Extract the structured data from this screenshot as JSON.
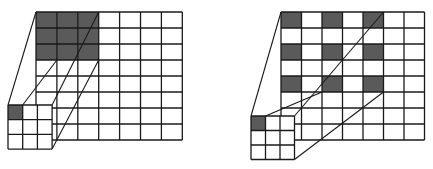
{
  "colors": {
    "shade": "#5a5a5a",
    "line": "#1a1a1a",
    "background": "#ffffff"
  },
  "panels": [
    {
      "name": "standard-convolution",
      "input_grid": {
        "x": 36,
        "y": 12,
        "cols": 7,
        "rows": 8,
        "cw": 20.9,
        "rh": 16,
        "shaded": [
          [
            0,
            0
          ],
          [
            0,
            1
          ],
          [
            0,
            2
          ],
          [
            1,
            0
          ],
          [
            1,
            1
          ],
          [
            1,
            2
          ],
          [
            2,
            0
          ],
          [
            2,
            1
          ],
          [
            2,
            2
          ]
        ]
      },
      "kernel": {
        "x": 8,
        "y": 105,
        "size": 3,
        "cell": 14.7,
        "depth_dx": 28,
        "depth_dy": -47,
        "shaded": [
          [
            0,
            0
          ]
        ]
      },
      "receptive_field": {
        "x": 36,
        "y": 12,
        "w": 62.7,
        "h": 48
      }
    },
    {
      "name": "dilated-convolution",
      "input_grid": {
        "x": 281,
        "y": 12,
        "cols": 7,
        "rows": 8,
        "cw": 20.5,
        "rh": 16,
        "shaded": [
          [
            0,
            0
          ],
          [
            0,
            2
          ],
          [
            0,
            4
          ],
          [
            2,
            0
          ],
          [
            2,
            2
          ],
          [
            2,
            4
          ],
          [
            4,
            0
          ],
          [
            4,
            2
          ],
          [
            4,
            4
          ]
        ]
      },
      "kernel": {
        "x": 251,
        "y": 116,
        "size": 3,
        "cell": 14.5,
        "depth_dx": 30,
        "depth_dy": -25,
        "shaded": [
          [
            0,
            0
          ]
        ]
      },
      "receptive_field": {
        "x": 281,
        "y": 12,
        "w": 102.5,
        "h": 80
      }
    }
  ]
}
